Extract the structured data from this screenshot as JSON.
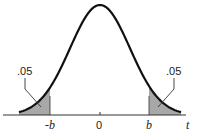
{
  "chart_data": {
    "type": "area",
    "title": "",
    "distribution": "t (symmetric bell curve)",
    "xlabel": "t",
    "ylabel": "",
    "tick_labels": [
      "-b",
      "0",
      "b"
    ],
    "shaded_regions": [
      {
        "name": "left tail",
        "from": "-inf",
        "to": "-b",
        "area": ".05"
      },
      {
        "name": "right tail",
        "from": "b",
        "to": "inf",
        "area": ".05"
      }
    ],
    "annotations": [
      ".05",
      ".05"
    ],
    "grid": false,
    "legend": "none"
  },
  "labels": {
    "left_area": ".05",
    "right_area": ".05",
    "tick_neg_b": "-b",
    "tick_zero": "0",
    "tick_b": "b",
    "axis_var": "t"
  },
  "colors": {
    "curve": "#111111",
    "shade": "#a8a8a8",
    "axis": "#333333"
  }
}
